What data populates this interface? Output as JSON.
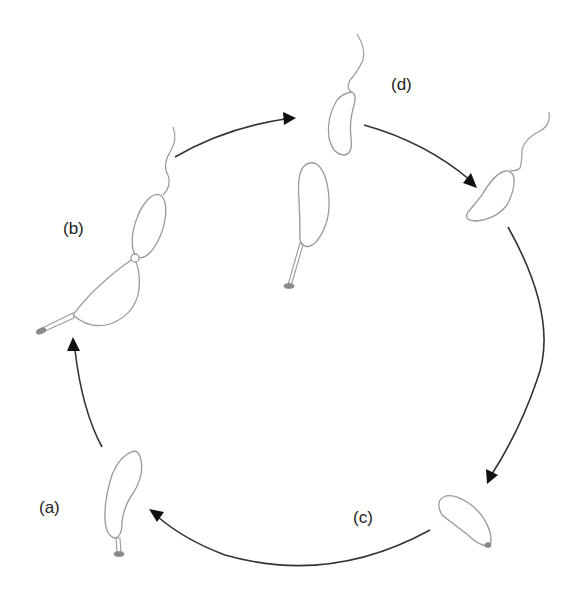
{
  "diagram": {
    "type": "life-cycle",
    "description_visible": "Cyclic diagram of stalked and swarmer bacterial cell stages connected by arrows",
    "stages": [
      {
        "id": "a",
        "label": "(a)",
        "depiction": "stalked cell attached via stalk with holdfast"
      },
      {
        "id": "b",
        "label": "(b)",
        "depiction": "dividing predivisional cell: stalked mother cell plus flagellated swarmer pole"
      },
      {
        "id": "d",
        "label": "(d)",
        "depiction": "separated stalked cell and flagellated swarmer cell"
      },
      {
        "id": "c",
        "label": "(c)",
        "depiction": "swarmer cell without flagellum, developing holdfast"
      }
    ],
    "arrows": [
      {
        "from": "b",
        "to": "d",
        "name": "arrow-b-to-d"
      },
      {
        "from": "d",
        "to": "swarmer",
        "name": "arrow-d-to-swarmer"
      },
      {
        "from": "swarmer",
        "to": "c",
        "name": "arrow-swarmer-to-c"
      },
      {
        "from": "c",
        "to": "a",
        "name": "arrow-c-to-a"
      },
      {
        "from": "a",
        "to": "b",
        "name": "arrow-a-to-b"
      }
    ],
    "colors": {
      "cell_outline": "#9a9a9a",
      "arrow": "#333333",
      "arrowhead": "#111111",
      "holdfast": "#8a8a8a",
      "label": "#222222",
      "background": "#ffffff"
    }
  }
}
